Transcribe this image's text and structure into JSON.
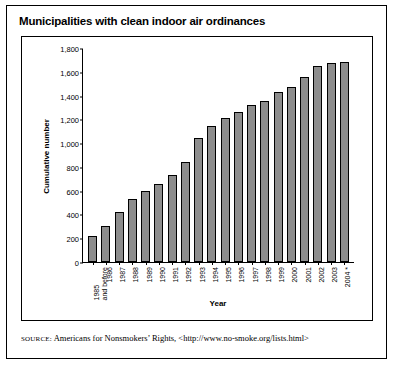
{
  "title": "Municipalities with clean indoor air ordinances",
  "source": {
    "label": "SOURCE:",
    "text": "Americans for Nonsmokers’ Rights, <http://www.no-smoke.org/lists.html>"
  },
  "chart_data": {
    "type": "bar",
    "title": "Municipalities with clean indoor air ordinances",
    "xlabel": "Year",
    "ylabel": "Cumulative number",
    "ylim": [
      0,
      1800
    ],
    "yticks": [
      0,
      200,
      400,
      600,
      800,
      1000,
      1200,
      1400,
      1600,
      1800
    ],
    "ytick_labels": [
      "0",
      "200",
      "400",
      "600",
      "800",
      "1,000",
      "1,200",
      "1,400",
      "1,600",
      "1,800"
    ],
    "grid": false,
    "legend": null,
    "bar_color": "#8d8d8d",
    "bar_edge_color": "#000000",
    "categories": [
      "1985\nand before",
      "1986",
      "1987",
      "1988",
      "1989",
      "1990",
      "1991",
      "1992",
      "1993",
      "1994",
      "1995",
      "1996",
      "1997",
      "1998",
      "1999",
      "2000",
      "2001",
      "2002",
      "2003",
      "2004 *"
    ],
    "values": [
      220,
      300,
      420,
      530,
      600,
      660,
      735,
      845,
      1040,
      1145,
      1215,
      1265,
      1320,
      1355,
      1430,
      1475,
      1560,
      1645,
      1675,
      1680
    ]
  }
}
